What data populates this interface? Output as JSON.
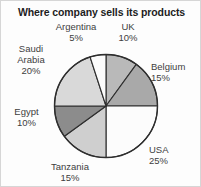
{
  "chart_data": {
    "type": "pie",
    "title": "Where company sells its products",
    "xlabel": "",
    "ylabel": "",
    "legend_position": "outside-labels",
    "grid": false,
    "start_angle_deg": 0,
    "direction": "clockwise",
    "categories": [
      "UK",
      "Belgium",
      "USA",
      "Tanzania",
      "Egypt",
      "Saudi Arabia",
      "Argentina"
    ],
    "values": [
      10,
      15,
      25,
      15,
      10,
      20,
      5
    ],
    "value_unit": "%",
    "total": 100,
    "slices": [
      {
        "label": "UK",
        "value": 10,
        "pct_text": "10%",
        "color": "#b9b9b9"
      },
      {
        "label": "Belgium",
        "value": 15,
        "pct_text": "15%",
        "color": "#a9a9a9"
      },
      {
        "label": "USA",
        "value": 25,
        "pct_text": "25%",
        "color": "#fcfcfc"
      },
      {
        "label": "Tanzania",
        "value": 15,
        "pct_text": "15%",
        "color": "#cfcfcf"
      },
      {
        "label": "Egypt",
        "value": 10,
        "pct_text": "10%",
        "color": "#8c8c8c"
      },
      {
        "label": "Saudi Arabia",
        "value": 20,
        "pct_text": "20%",
        "color": "#d9d9d9"
      },
      {
        "label": "Argentina",
        "value": 5,
        "pct_text": "5%",
        "color": "#fbfbfb"
      }
    ],
    "stroke_color": "#2e2e2e"
  },
  "labels": {
    "argentina": {
      "name": "Argentina",
      "pct": "5%"
    },
    "uk": {
      "name": "UK",
      "pct": "10%"
    },
    "saudi": {
      "name_line1": "Saudi",
      "name_line2": "Arabia",
      "pct": "20%"
    },
    "belgium": {
      "name": "Belgium",
      "pct": "15%"
    },
    "egypt": {
      "name": "Egypt",
      "pct": "10%"
    },
    "usa": {
      "name": "USA",
      "pct": "25%"
    },
    "tanzania": {
      "name": "Tanzania",
      "pct": "15%"
    }
  }
}
